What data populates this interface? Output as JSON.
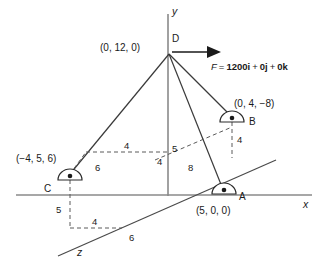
{
  "figure": {
    "background_color": "#ffffff",
    "line_color": "#3a3a3a",
    "text_color": "#1a1a1a"
  },
  "axes": [
    {
      "name": "y-axis",
      "label": "y",
      "direction": "vertical-up"
    },
    {
      "name": "x-axis",
      "label": "x",
      "direction": "horizontal-right"
    },
    {
      "name": "z-axis",
      "label": "z",
      "direction": "diagonal-lower-left"
    }
  ],
  "force": {
    "symbol": "F",
    "equals": "=",
    "i_term": "1200i",
    "plus1": "+",
    "j_term": "0j",
    "plus2": "+",
    "k_term": "0k",
    "full_text": "F = 1200i + 0j + 0k",
    "arrow_direction": "right"
  },
  "points": [
    {
      "id": "D",
      "label": "D",
      "coordinates": "(0, 12, 0)",
      "coords_value": [
        0,
        12,
        0
      ],
      "type": "cable-junction",
      "has_support_icon": false
    },
    {
      "id": "A",
      "label": "A",
      "coordinates": "(5, 0, 0)",
      "coords_value": [
        5,
        0,
        0
      ],
      "type": "ball-and-socket-support",
      "has_support_icon": true
    },
    {
      "id": "B",
      "label": "B",
      "coordinates": "(0, 4, −8)",
      "coords_value": [
        0,
        4,
        -8
      ],
      "type": "ball-and-socket-support",
      "has_support_icon": true
    },
    {
      "id": "C",
      "label": "C",
      "coordinates": "(−4, 5, 6)",
      "coords_value": [
        -4,
        5,
        6
      ],
      "type": "ball-and-socket-support",
      "has_support_icon": true
    }
  ],
  "cables": [
    {
      "name": "cable-DA",
      "from": "D",
      "to": "A"
    },
    {
      "name": "cable-DB",
      "from": "D",
      "to": "B"
    },
    {
      "name": "cable-DC",
      "from": "D",
      "to": "C"
    }
  ],
  "dimensions": [
    {
      "name": "dim-c-horizontal-4",
      "value": "4"
    },
    {
      "name": "dim-c-depth-6",
      "value": "6"
    },
    {
      "name": "dim-axis-5",
      "value": "5"
    },
    {
      "name": "dim-axis-4",
      "value": "4"
    },
    {
      "name": "dim-b-vertical-4",
      "value": "4"
    },
    {
      "name": "dim-da-8",
      "value": "8"
    },
    {
      "name": "dim-c-height-5",
      "value": "5"
    },
    {
      "name": "dim-base-4",
      "value": "4"
    },
    {
      "name": "dim-base-6",
      "value": "6"
    }
  ]
}
